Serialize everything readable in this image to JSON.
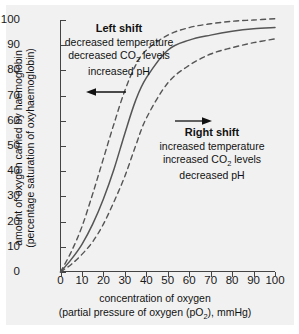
{
  "chart_data": {
    "type": "line",
    "title": "",
    "xlabel": "concentration of oxygen (partial pressure of oxygen (pO2), mmHg)",
    "ylabel": "amount of oxygen carried by haemoglobin (percentage saturation of oxyhaemoglobin)",
    "xlim": [
      0,
      100
    ],
    "ylim": [
      0,
      100
    ],
    "xticks": [
      0,
      10,
      20,
      30,
      40,
      50,
      60,
      70,
      80,
      90,
      100
    ],
    "yticks": [
      0,
      10,
      20,
      30,
      40,
      50,
      60,
      70,
      80,
      90,
      100
    ],
    "grid": false,
    "legend": "none",
    "x": [
      0,
      5,
      10,
      15,
      20,
      25,
      30,
      35,
      40,
      50,
      60,
      70,
      80,
      90,
      100
    ],
    "series": [
      {
        "name": "normal curve",
        "style": "solid",
        "values": [
          0,
          5,
          11,
          19,
          29,
          41,
          55,
          68,
          77,
          88,
          92,
          94,
          95.5,
          96.5,
          97
        ]
      },
      {
        "name": "left shift curve",
        "style": "dashed",
        "values": [
          0,
          8,
          18,
          31,
          45,
          59,
          72,
          82,
          88,
          94,
          97,
          98.5,
          99.5,
          100,
          100.5
        ]
      },
      {
        "name": "right shift curve",
        "style": "dashed",
        "values": [
          0,
          3,
          7,
          12,
          19,
          28,
          38,
          50,
          61,
          75,
          82,
          86.5,
          89,
          91,
          92.5
        ]
      }
    ],
    "annotations": [
      {
        "id": "left-shift",
        "heading": "Left shift",
        "lines": [
          "decreased temperature",
          "decreased CO2 levels",
          "increased pH"
        ],
        "arrow": "left"
      },
      {
        "id": "right-shift",
        "heading": "Right shift",
        "lines": [
          "increased temperature",
          "increased CO2 levels",
          "decreased pH"
        ],
        "arrow": "right"
      }
    ]
  },
  "axes": {
    "y_title_line1": "amount of oxygen carried by haemoglobin",
    "y_title_line2": "(percentage saturation of oxyhaemoglobin)",
    "x_title_line1": "concentration of oxygen",
    "x_title_line2_pre": "(partial pressure of oxygen (pO",
    "x_title_line2_sub": "2",
    "x_title_line2_post": "), mmHg)"
  },
  "annotations": {
    "left": {
      "heading": "Left shift",
      "line1": "decreased temperature",
      "line2_pre": "decreased CO",
      "line2_sub": "2",
      "line2_post": " levels",
      "line3": "increased pH"
    },
    "right": {
      "heading": "Right shift",
      "line1": "increased temperature",
      "line2_pre": "increased CO",
      "line2_sub": "2",
      "line2_post": " levels",
      "line3": "decreased pH"
    }
  },
  "colors": {
    "panel_bg": "#f1f1f1",
    "page_bg": "#ffffff",
    "axis": "#444444",
    "curve": "#555555",
    "text": "#111111"
  }
}
